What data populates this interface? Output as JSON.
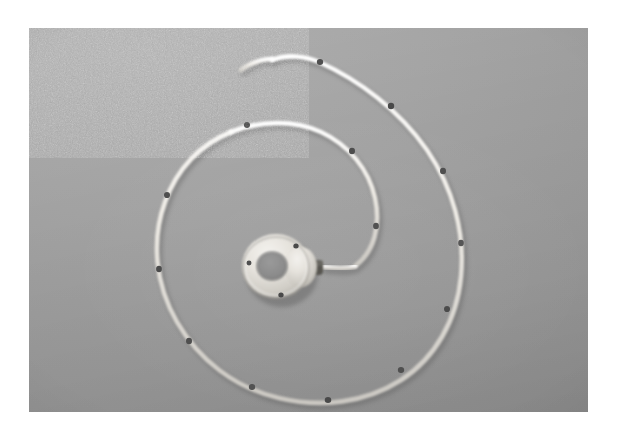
{
  "page": {
    "background_color": "#ffffff",
    "width": 617,
    "height": 437
  },
  "photo": {
    "name": "catheter-ring-photograph",
    "media_type": "grayscale-photograph",
    "frame": {
      "x": 29,
      "y": 28,
      "width": 559,
      "height": 384
    },
    "backdrop_color": "#9b9b9b",
    "backdrop_highlight_color": "#a9a9a9",
    "backdrop_shadow_color": "#8f8f8f",
    "subject": "white ring-shaped device with attached coiled marked cable",
    "objects": {
      "ring_device": {
        "label": "ring-device",
        "center": {
          "x": 276,
          "y": 265
        },
        "outer_radius_x": 33,
        "outer_radius_y": 31,
        "inner_radius_x": 14,
        "inner_radius_y": 13,
        "body_color": "#e8e6e1",
        "body_shadow_color": "#b3b0aa",
        "bore_color": "#8c8c8c",
        "port_holes": [
          {
            "x": 296,
            "y": 245,
            "r": 2.6
          },
          {
            "x": 249,
            "y": 262,
            "r": 2.4
          },
          {
            "x": 281,
            "y": 294,
            "r": 2.6
          }
        ],
        "hole_color": "#4a4a4a"
      },
      "strain_relief": {
        "label": "cable-strain-relief",
        "x": 305,
        "y": 267,
        "width": 18,
        "height": 11,
        "color": "#56544f"
      },
      "cable": {
        "label": "marked-catheter-cable",
        "color": "#efece6",
        "shadow_color": "#7e7e7e",
        "width": 4.6,
        "free_end": {
          "x": 272,
          "y": 60
        },
        "marker_color": "#4f4f4f",
        "marker_count": 12
      }
    }
  },
  "chart_data": {
    "type": "scatter",
    "title": "",
    "xlabel": "",
    "ylabel": "",
    "note": "not-a-chart"
  }
}
